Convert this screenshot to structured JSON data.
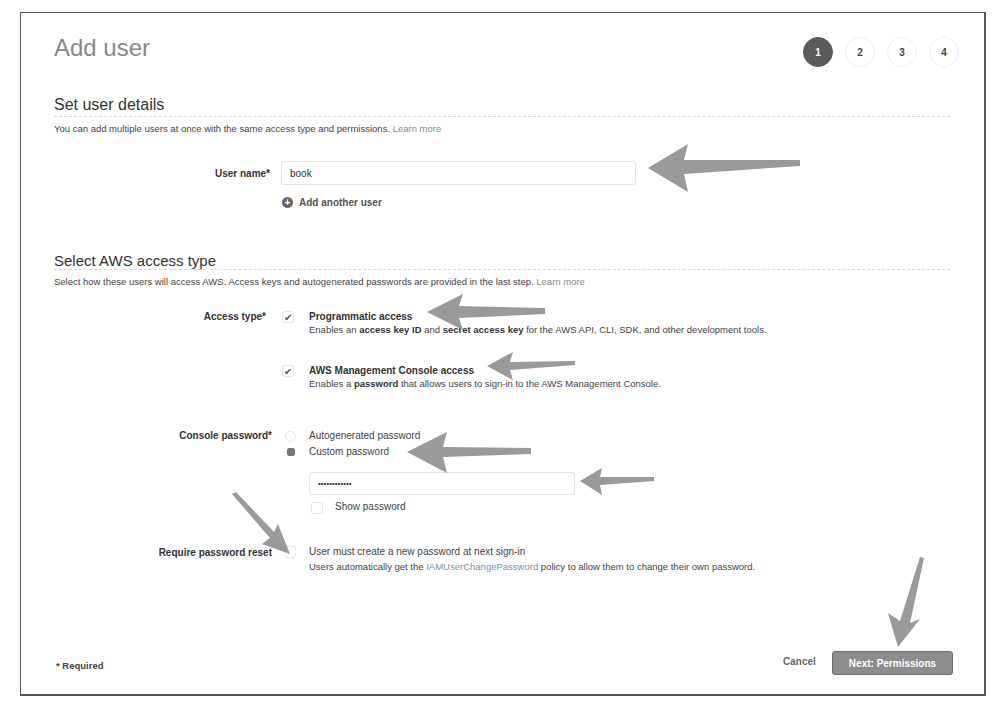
{
  "page": {
    "title": "Add user",
    "steps": [
      "1",
      "2",
      "3",
      "4"
    ],
    "active_step": "1"
  },
  "user_details": {
    "heading": "Set user details",
    "description": "You can add multiple users at once with the same access type and permissions.",
    "learn_more": "Learn more",
    "user_name_label": "User name*",
    "user_name_value": "book",
    "add_another_label": "Add another user"
  },
  "access_type": {
    "heading": "Select AWS access type",
    "description": "Select how these users will access AWS. Access keys and autogenerated passwords are provided in the last step.",
    "learn_more": "Learn more",
    "label": "Access type*",
    "options": [
      {
        "title": "Programmatic access",
        "checked": true,
        "desc_pre": "Enables an ",
        "desc_b1": "access key ID",
        "desc_mid": " and ",
        "desc_b2": "secret access key",
        "desc_post": " for the AWS API, CLI, SDK, and other development tools."
      },
      {
        "title": "AWS Management Console access",
        "checked": true,
        "desc_pre": "Enables a ",
        "desc_b1": "password",
        "desc_post": " that allows users to sign-in to the AWS Management Console."
      }
    ]
  },
  "console_password": {
    "label": "Console password*",
    "options": [
      {
        "label": "Autogenerated password",
        "selected": false
      },
      {
        "label": "Custom password",
        "selected": true
      }
    ],
    "password_value": "••••••••••••",
    "show_password_label": "Show password"
  },
  "password_reset": {
    "label": "Require password reset",
    "checkbox_label": "User must create a new password at next sign-in",
    "desc_pre": "Users automatically get the ",
    "policy_link": "IAMUserChangePassword",
    "desc_post": " policy to allow them to change their own password."
  },
  "footer": {
    "required_note": "* Required",
    "cancel_label": "Cancel",
    "next_label": "Next: Permissions"
  },
  "checkmark_glyph": "✔",
  "plus_glyph": "+"
}
